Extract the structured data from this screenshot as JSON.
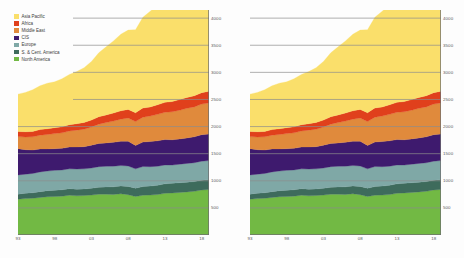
{
  "figure": {
    "background": "#fdfdfd",
    "panels": [
      "left",
      "right"
    ]
  },
  "legend": {
    "position": "top-left-of-left-panel",
    "items": [
      {
        "label": "Asia Pacific",
        "color": "#FADF6B"
      },
      {
        "label": "Africa",
        "color": "#E0401C"
      },
      {
        "label": "Middle East",
        "color": "#E08A3C"
      },
      {
        "label": "CIS",
        "color": "#3E1A6E"
      },
      {
        "label": "Europe",
        "color": "#7FA8A6"
      },
      {
        "label": "S. & Cent. America",
        "color": "#3E6B5C"
      },
      {
        "label": "North America",
        "color": "#72B944"
      }
    ]
  },
  "axes": {
    "y_ticks": [
      "4000",
      "3500",
      "3000",
      "2500",
      "2000",
      "1500",
      "1000",
      "500"
    ],
    "y_values": [
      4000,
      3500,
      3000,
      2500,
      2000,
      1500,
      1000,
      500
    ],
    "ylim": [
      0,
      4150
    ],
    "x_ticks": [
      "93",
      "98",
      "03",
      "08",
      "13",
      "18"
    ],
    "x_tick_values": [
      1993,
      1998,
      2003,
      2008,
      2013,
      2018
    ],
    "xlim": [
      1993,
      2019
    ],
    "grid": "horizontal",
    "tick_color": "#5a5a5a",
    "grid_color": "#8c8c8c",
    "axis_color": "#6e6e6e"
  },
  "chart_data": [
    {
      "type": "area",
      "stacked": true,
      "title": "",
      "xlabel": "",
      "ylabel": "",
      "xlim": [
        1993,
        2019
      ],
      "ylim": [
        0,
        4150
      ],
      "grid": true,
      "legend_position": "top-left",
      "x": [
        1993,
        1994,
        1995,
        1996,
        1997,
        1998,
        1999,
        2000,
        2001,
        2002,
        2003,
        2004,
        2005,
        2006,
        2007,
        2008,
        2009,
        2010,
        2011,
        2012,
        2013,
        2014,
        2015,
        2016,
        2017,
        2018,
        2019
      ],
      "categories": [
        "93",
        "94",
        "95",
        "96",
        "97",
        "98",
        "99",
        "00",
        "01",
        "02",
        "03",
        "04",
        "05",
        "06",
        "07",
        "08",
        "09",
        "10",
        "11",
        "12",
        "13",
        "14",
        "15",
        "16",
        "17",
        "18",
        "19"
      ],
      "series": [
        {
          "name": "North America",
          "color": "#72B944",
          "values": [
            660,
            672,
            676,
            692,
            706,
            710,
            716,
            733,
            722,
            728,
            736,
            752,
            752,
            748,
            760,
            744,
            710,
            733,
            736,
            746,
            768,
            776,
            784,
            795,
            805,
            830,
            840
          ]
        },
        {
          "name": "S. & Cent. America",
          "color": "#3E6B5C",
          "values": [
            93,
            98,
            103,
            108,
            112,
            116,
            118,
            121,
            123,
            122,
            124,
            130,
            135,
            140,
            146,
            152,
            152,
            160,
            166,
            171,
            175,
            178,
            180,
            180,
            180,
            182,
            184
          ]
        },
        {
          "name": "Europe",
          "color": "#7FA8A6",
          "values": [
            355,
            352,
            356,
            364,
            362,
            366,
            366,
            366,
            371,
            370,
            376,
            379,
            380,
            382,
            375,
            377,
            358,
            370,
            358,
            352,
            348,
            336,
            342,
            346,
            348,
            350,
            348
          ]
        },
        {
          "name": "CIS",
          "color": "#3E1A6E",
          "values": [
            485,
            452,
            432,
            424,
            408,
            400,
            398,
            402,
            408,
            410,
            420,
            428,
            432,
            440,
            448,
            456,
            432,
            452,
            464,
            468,
            470,
            466,
            466,
            470,
            478,
            488,
            492
          ]
        },
        {
          "name": "Middle East",
          "color": "#E08A3C",
          "values": [
            222,
            234,
            244,
            253,
            265,
            278,
            286,
            296,
            310,
            322,
            336,
            356,
            374,
            392,
            408,
            428,
            440,
            458,
            470,
            488,
            502,
            516,
            530,
            546,
            552,
            566,
            572
          ]
        },
        {
          "name": "Africa",
          "color": "#E0401C",
          "values": [
            93,
            96,
            99,
            103,
            107,
            110,
            112,
            116,
            120,
            124,
            128,
            136,
            142,
            148,
            154,
            160,
            162,
            170,
            168,
            178,
            184,
            190,
            196,
            200,
            204,
            210,
            214
          ]
        },
        {
          "name": "Asia Pacific",
          "color": "#FADF6B",
          "values": [
            690,
            726,
            768,
            808,
            840,
            846,
            886,
            928,
            960,
            1010,
            1080,
            1180,
            1256,
            1330,
            1412,
            1462,
            1532,
            1672,
            1766,
            1840,
            1900,
            1950,
            1986,
            2030,
            2096,
            2158,
            2206
          ]
        }
      ]
    },
    {
      "type": "area",
      "stacked": true,
      "title": "",
      "xlabel": "",
      "ylabel": "",
      "xlim": [
        1993,
        2019
      ],
      "ylim": [
        0,
        4150
      ],
      "grid": true,
      "legend_position": "none",
      "x": [
        1993,
        1994,
        1995,
        1996,
        1997,
        1998,
        1999,
        2000,
        2001,
        2002,
        2003,
        2004,
        2005,
        2006,
        2007,
        2008,
        2009,
        2010,
        2011,
        2012,
        2013,
        2014,
        2015,
        2016,
        2017,
        2018,
        2019
      ],
      "categories": [
        "93",
        "94",
        "95",
        "96",
        "97",
        "98",
        "99",
        "00",
        "01",
        "02",
        "03",
        "04",
        "05",
        "06",
        "07",
        "08",
        "09",
        "10",
        "11",
        "12",
        "13",
        "14",
        "15",
        "16",
        "17",
        "18",
        "19"
      ],
      "series": [
        {
          "name": "North America",
          "color": "#72B944",
          "values": [
            660,
            672,
            676,
            692,
            706,
            710,
            716,
            733,
            722,
            728,
            736,
            752,
            752,
            748,
            760,
            744,
            710,
            733,
            736,
            746,
            768,
            776,
            784,
            795,
            805,
            830,
            840
          ]
        },
        {
          "name": "S. & Cent. America",
          "color": "#3E6B5C",
          "values": [
            93,
            98,
            103,
            108,
            112,
            116,
            118,
            121,
            123,
            122,
            124,
            130,
            135,
            140,
            146,
            152,
            152,
            160,
            166,
            171,
            175,
            178,
            180,
            180,
            180,
            182,
            184
          ]
        },
        {
          "name": "Europe",
          "color": "#7FA8A6",
          "values": [
            355,
            352,
            356,
            364,
            362,
            366,
            366,
            366,
            371,
            370,
            376,
            379,
            380,
            382,
            375,
            377,
            358,
            370,
            358,
            352,
            348,
            336,
            342,
            346,
            348,
            350,
            348
          ]
        },
        {
          "name": "CIS",
          "color": "#3E1A6E",
          "values": [
            485,
            452,
            432,
            424,
            408,
            400,
            398,
            402,
            408,
            410,
            420,
            428,
            432,
            440,
            448,
            456,
            432,
            452,
            464,
            468,
            470,
            466,
            466,
            470,
            478,
            488,
            492
          ]
        },
        {
          "name": "Middle East",
          "color": "#E08A3C",
          "values": [
            222,
            234,
            244,
            253,
            265,
            278,
            286,
            296,
            310,
            322,
            336,
            356,
            374,
            392,
            408,
            428,
            440,
            458,
            470,
            488,
            502,
            516,
            530,
            546,
            552,
            566,
            572
          ]
        },
        {
          "name": "Africa",
          "color": "#E0401C",
          "values": [
            93,
            96,
            99,
            103,
            107,
            110,
            112,
            116,
            120,
            124,
            128,
            136,
            142,
            148,
            154,
            160,
            162,
            170,
            168,
            178,
            184,
            190,
            196,
            200,
            204,
            210,
            214
          ]
        },
        {
          "name": "Asia Pacific",
          "color": "#FADF6B",
          "values": [
            690,
            726,
            768,
            808,
            840,
            846,
            886,
            928,
            960,
            1010,
            1080,
            1180,
            1256,
            1330,
            1412,
            1462,
            1532,
            1672,
            1766,
            1840,
            1900,
            1950,
            1986,
            2030,
            2096,
            2158,
            2206
          ]
        }
      ]
    }
  ]
}
